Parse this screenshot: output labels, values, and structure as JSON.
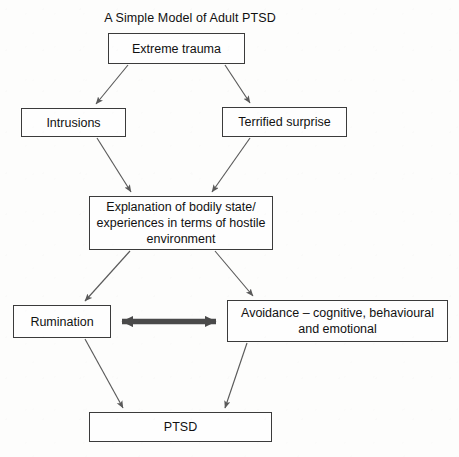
{
  "diagram": {
    "title": "A Simple Model of Adult PTSD",
    "type": "flowchart",
    "background_color": "#fdfdfc",
    "box_border_color": "#3b3b3b",
    "arrow_color": "#5a5a5a",
    "thick_arrow_color": "#4a4a4a",
    "text_color": "#111111",
    "nodes": [
      {
        "id": "trauma",
        "label": "Extreme trauma",
        "x": 108,
        "y": 33,
        "width": 137,
        "height": 31
      },
      {
        "id": "intrusions",
        "label": "Intrusions",
        "x": 21,
        "y": 108,
        "width": 105,
        "height": 29
      },
      {
        "id": "terrified",
        "label": "Terrified surprise",
        "x": 222,
        "y": 107,
        "width": 125,
        "height": 30
      },
      {
        "id": "explanation",
        "label": "Explanation of bodily state/\nexperiences in terms of hostile\nenvironment",
        "x": 89,
        "y": 196,
        "width": 184,
        "height": 54
      },
      {
        "id": "rumination",
        "label": "Rumination",
        "x": 13,
        "y": 305,
        "width": 98,
        "height": 33
      },
      {
        "id": "avoidance",
        "label": "Avoidance – cognitive, behavioural\nand emotional",
        "x": 227,
        "y": 300,
        "width": 221,
        "height": 42
      },
      {
        "id": "ptsd",
        "label": "PTSD",
        "x": 89,
        "y": 412,
        "width": 183,
        "height": 30
      }
    ],
    "edges": [
      {
        "id": "trauma-to-intrusions",
        "from": "trauma",
        "to": "intrusions",
        "style": "thin-arrow",
        "direction": "one-way"
      },
      {
        "id": "trauma-to-terrified",
        "from": "trauma",
        "to": "terrified",
        "style": "thin-arrow",
        "direction": "one-way"
      },
      {
        "id": "intrusions-to-explanation",
        "from": "intrusions",
        "to": "explanation",
        "style": "thin-arrow",
        "direction": "one-way"
      },
      {
        "id": "terrified-to-explanation",
        "from": "terrified",
        "to": "explanation",
        "style": "thin-arrow",
        "direction": "one-way"
      },
      {
        "id": "explanation-to-rumination",
        "from": "explanation",
        "to": "rumination",
        "style": "thin-arrow",
        "direction": "one-way"
      },
      {
        "id": "explanation-to-avoidance",
        "from": "explanation",
        "to": "avoidance",
        "style": "thin-arrow",
        "direction": "one-way"
      },
      {
        "id": "rumination-avoidance",
        "from": "rumination",
        "to": "avoidance",
        "style": "thick-arrow",
        "direction": "two-way"
      },
      {
        "id": "rumination-to-ptsd",
        "from": "rumination",
        "to": "ptsd",
        "style": "thin-arrow",
        "direction": "one-way"
      },
      {
        "id": "avoidance-to-ptsd",
        "from": "avoidance",
        "to": "ptsd",
        "style": "thin-arrow",
        "direction": "one-way"
      }
    ]
  }
}
